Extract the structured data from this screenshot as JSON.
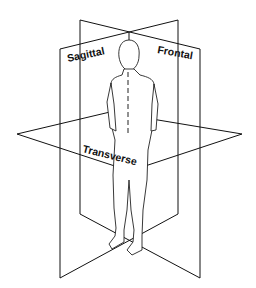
{
  "diagram": {
    "planes": [
      {
        "id": "sagittal",
        "label": "Sagittal"
      },
      {
        "id": "frontal",
        "label": "Frontal"
      },
      {
        "id": "transverse",
        "label": "Transverse"
      }
    ],
    "colors": {
      "line": "#111111",
      "background": "#ffffff"
    }
  }
}
